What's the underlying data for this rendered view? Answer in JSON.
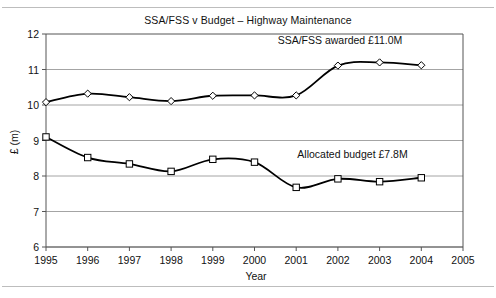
{
  "chart_data": {
    "type": "line",
    "title": "SSA/FSS v Budget – Highway Maintenance",
    "xlabel": "Year",
    "ylabel": "£ (m)",
    "x": [
      1995,
      1996,
      1997,
      1998,
      1999,
      2000,
      2001,
      2002,
      2003,
      2004
    ],
    "xtick_labels": [
      "1995",
      "1996",
      "1997",
      "1998",
      "1999",
      "2000",
      "2001",
      "2002",
      "2003",
      "2004",
      "2005"
    ],
    "ytick_labels": [
      "6",
      "7",
      "8",
      "9",
      "10",
      "11",
      "12"
    ],
    "xlim": [
      1995,
      2005
    ],
    "ylim": [
      6,
      12
    ],
    "grid": "horizontal",
    "legend": "none",
    "smoothing": "spline",
    "series": [
      {
        "name": "SSA/FSS awarded",
        "marker": "diamond",
        "color": "#000000",
        "values": [
          10.08,
          10.32,
          10.22,
          10.11,
          10.26,
          10.27,
          10.27,
          11.11,
          11.2,
          11.12
        ]
      },
      {
        "name": "Allocated budget",
        "marker": "square",
        "color": "#000000",
        "values": [
          9.1,
          8.52,
          8.34,
          8.13,
          8.47,
          8.39,
          7.68,
          7.92,
          7.84,
          7.95
        ]
      }
    ],
    "annotations": [
      {
        "text": "SSA/FSS awarded £11.0M",
        "x": 2002.05,
        "y": 11.72
      },
      {
        "text": "Allocated budget £7.8M",
        "x": 2002.35,
        "y": 8.52
      }
    ]
  }
}
